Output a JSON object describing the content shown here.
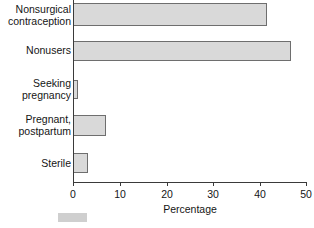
{
  "chart_data": {
    "type": "bar",
    "orientation": "horizontal",
    "title": "",
    "xlabel": "Percentage",
    "ylabel": "",
    "xlim": [
      0,
      50
    ],
    "xticks": [
      0,
      10,
      20,
      30,
      40,
      50
    ],
    "grid": false,
    "legend": null,
    "categories": [
      "Nonsurgical\ncontraception",
      "Nonusers",
      "Seeking\npregnancy",
      "Pregnant,\npostpartum",
      "Sterile"
    ],
    "values": [
      41.4,
      46.6,
      1.1,
      7.1,
      3.2
    ],
    "bar_fill_color": "#d9d9d9",
    "bar_border_color": "#6e6e6e",
    "axis_color": "#3a3a3a"
  }
}
